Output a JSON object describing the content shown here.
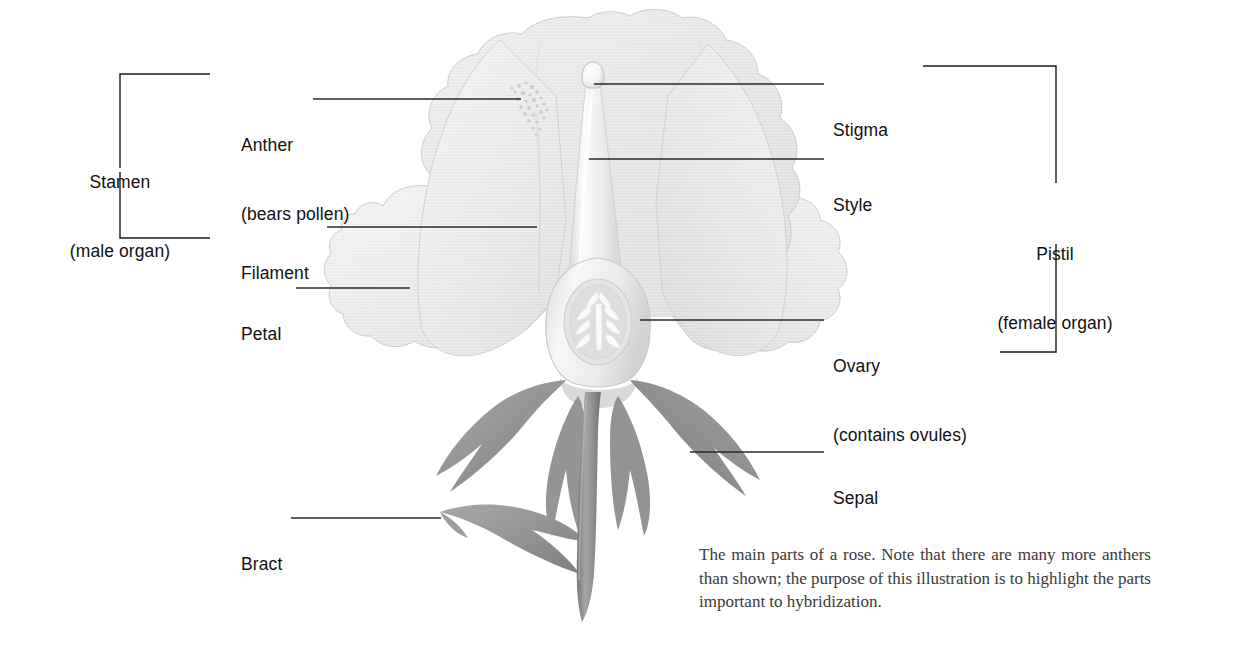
{
  "figure": {
    "title": "The main parts of a rose"
  },
  "labels": {
    "anther": {
      "line1": "Anther",
      "line2": "(bears pollen)"
    },
    "filament": {
      "line1": "Filament"
    },
    "petal": {
      "line1": "Petal"
    },
    "bract": {
      "line1": "Bract"
    },
    "stigma": {
      "line1": "Stigma"
    },
    "style": {
      "line1": "Style"
    },
    "ovary": {
      "line1": "Ovary",
      "line2": "(contains ovules)"
    },
    "sepal": {
      "line1": "Sepal"
    }
  },
  "brackets": {
    "stamen": {
      "line1": "Stamen",
      "line2": "(male organ)"
    },
    "pistil": {
      "line1": "Pistil",
      "line2": "(female organ)"
    }
  },
  "caption": {
    "text": "The main parts of a rose. Note that there are many more anthers than shown; the purpose of this illustration is to highlight the parts important to hybridization."
  },
  "colors": {
    "ink": "#111111",
    "leader_line": "#2a2a2a",
    "caption_text": "#3a3a3a",
    "petal_light": "#f0f0f0",
    "petal_mid": "#e6e6e6",
    "petal_dark": "#dcdcdc",
    "petal_outline": "#c9c9c9",
    "pistil_light": "#f6f6f6",
    "pistil_shade": "#dadada",
    "ovary_ring": "#d4d4d4",
    "ovule_white": "#fafafa",
    "sepal_gray": "#9a9a9a",
    "sepal_dark": "#7e7e7e",
    "stem_gray": "#8f8f8f",
    "background": "#ffffff"
  }
}
